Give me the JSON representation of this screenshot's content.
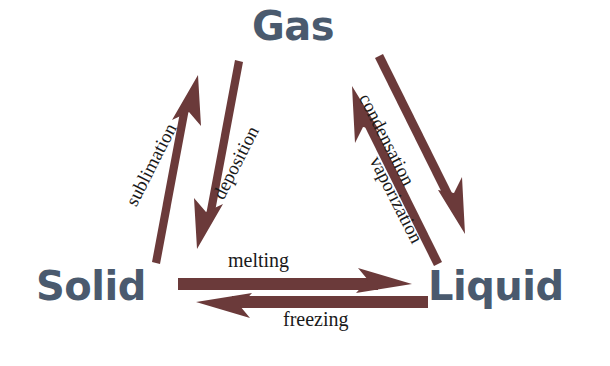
{
  "diagram": {
    "type": "phase-transition-triangle",
    "background_color": "#ffffff",
    "arrow_color": "#6b3a3a",
    "state_label_color": "#4a5a6e",
    "process_label_color": "#1a1a1a",
    "states": [
      {
        "id": "gas",
        "label": "Gas",
        "position": "top"
      },
      {
        "id": "solid",
        "label": "Solid",
        "position": "bottom-left"
      },
      {
        "id": "liquid",
        "label": "Liquid",
        "position": "bottom-right"
      }
    ],
    "transitions": [
      {
        "id": "sublimation",
        "label": "sublimation",
        "from": "Solid",
        "to": "Gas",
        "side": "left",
        "direction": "up"
      },
      {
        "id": "deposition",
        "label": "deposition",
        "from": "Gas",
        "to": "Solid",
        "side": "left",
        "direction": "down"
      },
      {
        "id": "condensation",
        "label": "condensation",
        "from": "Gas",
        "to": "Liquid",
        "side": "right",
        "direction": "down"
      },
      {
        "id": "vaporization",
        "label": "vaporization",
        "from": "Liquid",
        "to": "Gas",
        "side": "right",
        "direction": "up"
      },
      {
        "id": "melting",
        "label": "melting",
        "from": "Solid",
        "to": "Liquid",
        "side": "bottom",
        "direction": "right"
      },
      {
        "id": "freezing",
        "label": "freezing",
        "from": "Liquid",
        "to": "Solid",
        "side": "bottom",
        "direction": "left"
      }
    ]
  }
}
